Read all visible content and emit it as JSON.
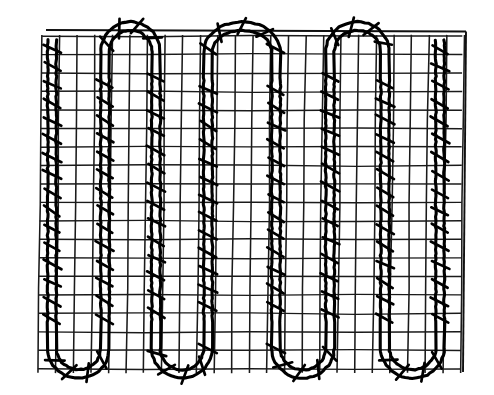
{
  "figure": {
    "caption": "",
    "kind": "technical-line-drawing",
    "background_color": "#ffffff",
    "ink_color": "#000000",
    "mesh_color": "#1a1a1a"
  },
  "canvas": {
    "width": 494,
    "height": 395
  },
  "mesh": {
    "name": "wire-mesh-grid",
    "x0": 38,
    "y0": 36,
    "x1": 461,
    "y1": 369,
    "cell_width": 17.6,
    "cell_height": 18.5,
    "vertical_line_count": 25,
    "horizontal_line_count": 19,
    "outer_frame_top_y": 30,
    "outer_frame_right_x": 466,
    "skew_x": 4
  },
  "pipe": {
    "name": "serpentine-pipe",
    "wall_gap": 8.5,
    "stroke_width": 3.1,
    "bend_radius": 26,
    "top_y": 52,
    "bottom_y": 348,
    "runs_x": [
      52,
      105,
      156,
      208,
      276,
      330,
      385,
      440
    ],
    "top_bend_centers_x": [
      130,
      255,
      378
    ],
    "bottom_bend_centers_x": [
      78,
      182,
      302,
      412
    ],
    "inlet": {
      "x": 52,
      "y": 40,
      "label": "inlet-stub"
    },
    "outlet": {
      "x": 440,
      "y": 40,
      "label": "outlet-stub"
    },
    "tie_spacing": 18,
    "tie_length": 19,
    "tie_angle_deg": 28
  },
  "chart_data": {
    "type": "line",
    "xlabel": "",
    "ylabel": "",
    "xlim": [
      38,
      461
    ],
    "ylim": [
      36,
      369
    ],
    "grid": true,
    "legend": "none",
    "series": [
      {
        "name": "serpentine-pipe-centerline",
        "x": [
          52,
          52,
          78,
          105,
          105,
          130,
          156,
          156,
          182,
          208,
          208,
          255,
          276,
          276,
          302,
          330,
          330,
          378,
          385,
          385,
          412,
          440,
          440
        ],
        "y": [
          40,
          322,
          348,
          322,
          78,
          52,
          78,
          322,
          348,
          322,
          78,
          52,
          78,
          322,
          348,
          322,
          78,
          52,
          78,
          322,
          348,
          322,
          40
        ]
      }
    ],
    "annotations": [
      {
        "text": "3 upper U-bends",
        "count": 3
      },
      {
        "text": "4 lower U-bends",
        "count": 4
      },
      {
        "text": "8 straight vertical runs",
        "count": 8
      }
    ]
  }
}
